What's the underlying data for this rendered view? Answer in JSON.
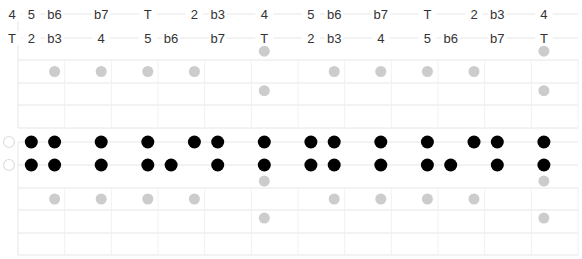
{
  "diagram": {
    "title": "",
    "colors": {
      "grid": "#e6e6e6",
      "root_dot": "#000000",
      "ghost_dot": "#cccccc",
      "open_string": "#dddddd",
      "label": "#333333"
    },
    "columns": [
      0,
      1,
      2,
      4,
      6,
      8,
      9,
      11,
      13,
      14,
      16,
      18,
      19,
      20,
      22
    ],
    "label_rows": [
      {
        "name": "upper-string",
        "labels": [
          {
            "col": 0,
            "text": "4"
          },
          {
            "col": 1,
            "text": "5"
          },
          {
            "col": 2,
            "text": "b6"
          },
          {
            "col": 4,
            "text": "b7"
          },
          {
            "col": 6,
            "text": "T"
          },
          {
            "col": 8,
            "text": "2"
          },
          {
            "col": 9,
            "text": "b3"
          },
          {
            "col": 11,
            "text": "4"
          },
          {
            "col": 13,
            "text": "5"
          },
          {
            "col": 14,
            "text": "b6"
          },
          {
            "col": 16,
            "text": "b7"
          },
          {
            "col": 18,
            "text": "T"
          },
          {
            "col": 20,
            "text": "2"
          },
          {
            "col": 21,
            "text": "b3"
          },
          {
            "col": 23,
            "text": "4"
          }
        ]
      },
      {
        "name": "lower-string",
        "labels": [
          {
            "col": 0,
            "text": "T"
          },
          {
            "col": 1,
            "text": "2"
          },
          {
            "col": 2,
            "text": "b3"
          },
          {
            "col": 4,
            "text": "4"
          },
          {
            "col": 6,
            "text": "5"
          },
          {
            "col": 7,
            "text": "b6"
          },
          {
            "col": 9,
            "text": "b7"
          },
          {
            "col": 11,
            "text": "T"
          },
          {
            "col": 13,
            "text": "2"
          },
          {
            "col": 14,
            "text": "b3"
          },
          {
            "col": 16,
            "text": "4"
          },
          {
            "col": 18,
            "text": "5"
          },
          {
            "col": 19,
            "text": "b6"
          },
          {
            "col": 21,
            "text": "b7"
          },
          {
            "col": 23,
            "text": "T"
          }
        ]
      }
    ],
    "top_grid_ghost_dots": [
      {
        "col": 2,
        "row": 2.5
      },
      {
        "col": 4,
        "row": 2.5
      },
      {
        "col": 6,
        "row": 2.5
      },
      {
        "col": 8,
        "row": 2.5
      },
      {
        "col": 14,
        "row": 2.5
      },
      {
        "col": 16,
        "row": 2.5
      },
      {
        "col": 18,
        "row": 2.5
      },
      {
        "col": 20,
        "row": 2.5
      },
      {
        "col": 11,
        "row": 1.6
      },
      {
        "col": 11,
        "row": 3.35
      },
      {
        "col": 23,
        "row": 1.6
      },
      {
        "col": 23,
        "row": 3.35
      }
    ],
    "dot_rows": [
      {
        "name": "string-1",
        "open": true,
        "cols": [
          1,
          2,
          4,
          6,
          8,
          9,
          11,
          13,
          14,
          16,
          18,
          20,
          21,
          23
        ]
      },
      {
        "name": "string-2",
        "open": true,
        "cols": [
          1,
          2,
          4,
          6,
          7,
          9,
          11,
          13,
          14,
          16,
          18,
          19,
          21,
          23
        ]
      }
    ],
    "bottom_grid_ghost_dots": [
      {
        "col": 2,
        "row": 2.5
      },
      {
        "col": 4,
        "row": 2.5
      },
      {
        "col": 6,
        "row": 2.5
      },
      {
        "col": 8,
        "row": 2.5
      },
      {
        "col": 14,
        "row": 2.5
      },
      {
        "col": 16,
        "row": 2.5
      },
      {
        "col": 18,
        "row": 2.5
      },
      {
        "col": 20,
        "row": 2.5
      },
      {
        "col": 11,
        "row": 1.7
      },
      {
        "col": 11,
        "row": 3.35
      },
      {
        "col": 23,
        "row": 1.7
      },
      {
        "col": 23,
        "row": 3.35
      }
    ]
  }
}
